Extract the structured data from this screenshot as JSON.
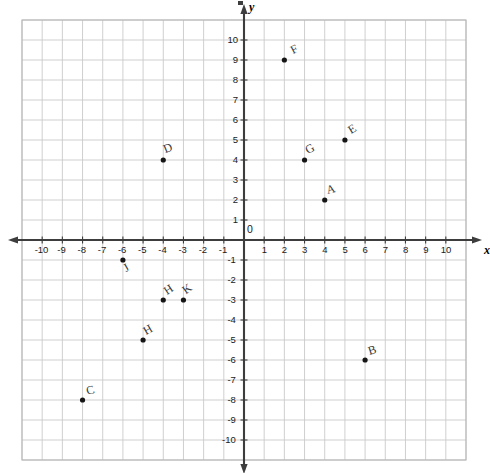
{
  "chart_data": {
    "type": "scatter",
    "title": "",
    "xlabel": "x",
    "ylabel": "y",
    "xlim": [
      -11,
      11
    ],
    "ylim": [
      -11,
      11
    ],
    "grid": true,
    "legend": "none",
    "origin_label": "0",
    "xticks": [
      -10,
      -9,
      -8,
      -7,
      -6,
      -5,
      -4,
      -3,
      -2,
      -1,
      1,
      2,
      3,
      4,
      5,
      6,
      7,
      8,
      9,
      10
    ],
    "yticks": [
      10,
      9,
      8,
      7,
      6,
      5,
      4,
      3,
      2,
      1,
      -1,
      -2,
      -3,
      -4,
      -5,
      -6,
      -7,
      -8,
      -9,
      -10
    ],
    "xtick_labels": [
      "-10",
      "-9",
      "-8",
      "-7",
      "-6",
      "-5",
      "-4",
      "-3",
      "-2",
      "-1",
      "1",
      "2",
      "3",
      "4",
      "5",
      "6",
      "7",
      "8",
      "9",
      "10"
    ],
    "ytick_labels": [
      "10",
      "9",
      "8",
      "7",
      "6",
      "5",
      "4",
      "3",
      "2",
      "1",
      "-1",
      "-2",
      "-3",
      "-4",
      "-5",
      "-6",
      "-7",
      "-8",
      "-9",
      "-10"
    ],
    "points": [
      {
        "label": "F",
        "x": 2,
        "y": 9,
        "lx": 10,
        "ly": -16
      },
      {
        "label": "E",
        "x": 5,
        "y": 5,
        "lx": 7,
        "ly": -16
      },
      {
        "label": "G",
        "x": 3,
        "y": 4,
        "lx": 4,
        "ly": -16
      },
      {
        "label": "D",
        "x": -4,
        "y": 4,
        "lx": 3,
        "ly": -17
      },
      {
        "label": "A",
        "x": 4,
        "y": 2,
        "lx": 3,
        "ly": -16
      },
      {
        "label": "J",
        "x": -6,
        "y": -1,
        "lx": 4,
        "ly": 2
      },
      {
        "label": "H",
        "x": -4,
        "y": -3,
        "lx": 5,
        "ly": -15
      },
      {
        "label": "K",
        "x": -3,
        "y": -3,
        "lx": 4,
        "ly": -16
      },
      {
        "label": "H",
        "x": -5,
        "y": -5,
        "lx": 4,
        "ly": -15
      },
      {
        "label": "B",
        "x": 6,
        "y": -6,
        "lx": 5,
        "ly": -15
      },
      {
        "label": "C",
        "x": -8,
        "y": -8,
        "lx": 5,
        "ly": -15
      }
    ]
  },
  "colors": {
    "grid": "#c9c9c9",
    "axis": "#3d3d3d",
    "point": "#151515",
    "frame": "#b8b8b8",
    "label_text": "#3a3a3a"
  }
}
